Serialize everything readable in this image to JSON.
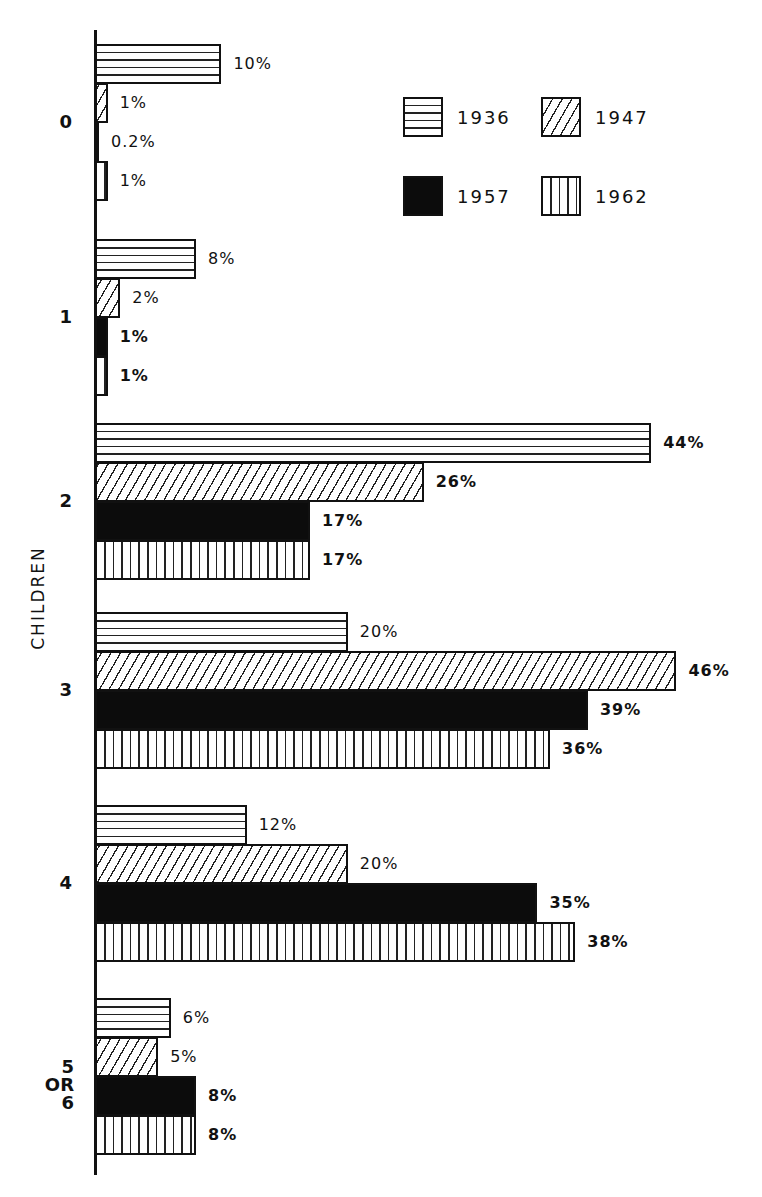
{
  "chart_data": {
    "type": "bar",
    "orientation": "horizontal",
    "title": "",
    "xlabel": "",
    "ylabel": "CHILDREN",
    "categories": [
      "0",
      "1",
      "2",
      "3",
      "4",
      "5 OR 6"
    ],
    "series": [
      {
        "name": "1936",
        "pattern": "horizontal-lines",
        "values": [
          10,
          8,
          44,
          20,
          12,
          6
        ]
      },
      {
        "name": "1947",
        "pattern": "diagonal-hatch",
        "values": [
          1,
          2,
          26,
          46,
          20,
          5
        ]
      },
      {
        "name": "1957",
        "pattern": "solid-black",
        "values": [
          0.2,
          1,
          17,
          39,
          35,
          8
        ]
      },
      {
        "name": "1962",
        "pattern": "vertical-lines",
        "values": [
          1,
          1,
          17,
          36,
          38,
          8
        ]
      }
    ],
    "value_labels": [
      [
        "10%",
        "1%",
        "0.2%",
        "1%"
      ],
      [
        "8%",
        "2%",
        "1%",
        "1%"
      ],
      [
        "44%",
        "26%",
        "17%",
        "17%"
      ],
      [
        "20%",
        "46%",
        "39%",
        "36%"
      ],
      [
        "12%",
        "20%",
        "35%",
        "38%"
      ],
      [
        "6%",
        "5%",
        "8%",
        "8%"
      ]
    ],
    "unit": "%",
    "grid": false,
    "legend_position": "upper-right",
    "xlim": [
      0,
      50
    ]
  },
  "legend": [
    {
      "label": "1936",
      "pattern": "p1936"
    },
    {
      "label": "1947",
      "pattern": "p1947"
    },
    {
      "label": "1957",
      "pattern": "p1957"
    },
    {
      "label": "1962",
      "pattern": "p1962"
    }
  ],
  "colors": {
    "ink": "#111111",
    "background": "#ffffff"
  }
}
